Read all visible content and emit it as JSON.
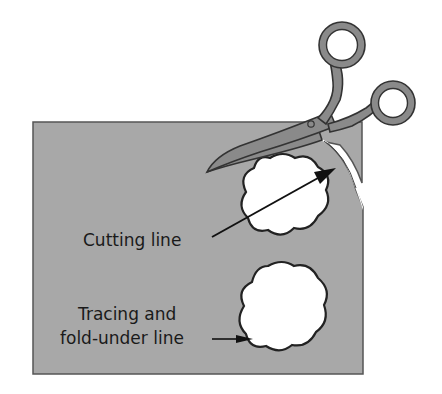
{
  "figure": {
    "labels": {
      "cutting_line": "Cutting line",
      "tracing_line_1": "Tracing and",
      "tracing_line_2": "fold-under line"
    },
    "colors": {
      "fabric": "#a8a8a8",
      "fabric_border": "#555555",
      "scissors": "#8a8a8a",
      "outline": "#222222",
      "background": "#ffffff"
    },
    "elements": [
      "fabric-sheet",
      "scissors",
      "upper-cloud-shape",
      "lower-cloud-shape",
      "cutting-line-arrow",
      "tracing-line-arrow",
      "cut-slit"
    ]
  }
}
